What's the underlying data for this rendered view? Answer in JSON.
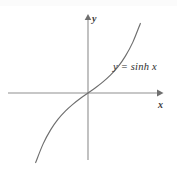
{
  "figure": {
    "title": "",
    "background_color": "#ffffff",
    "axis_color": "#8f8f8f",
    "curve_color": "#6e6e6e",
    "text_color": "#2e2e2e"
  },
  "labels": {
    "y_axis": "y",
    "x_axis": "x",
    "equation": "y = sinh x"
  },
  "chart_data": {
    "type": "line",
    "title": "",
    "xlabel": "x",
    "ylabel": "y",
    "annotations": [
      "y = sinh x"
    ],
    "grid": false,
    "legend": "none",
    "xlim": [
      -3,
      3
    ],
    "ylim": [
      -4.2,
      4.2
    ],
    "origin_px": [
      88,
      93
    ],
    "x": [
      -2.1,
      -1.8,
      -1.5,
      -1.2,
      -0.9,
      -0.6,
      -0.3,
      0,
      0.3,
      0.6,
      0.9,
      1.2,
      1.5,
      1.8,
      2.1
    ],
    "y": [
      -4.02,
      -2.94,
      -2.13,
      -1.51,
      -1.03,
      -0.64,
      -0.3,
      0,
      0.3,
      0.64,
      1.03,
      1.51,
      2.13,
      2.94,
      4.02
    ],
    "series": [
      {
        "name": "y = sinh x",
        "x": [
          -2.1,
          -1.8,
          -1.5,
          -1.2,
          -0.9,
          -0.6,
          -0.3,
          0,
          0.3,
          0.6,
          0.9,
          1.2,
          1.5,
          1.8,
          2.1
        ],
        "values": [
          -4.02,
          -2.94,
          -2.13,
          -1.51,
          -1.03,
          -0.64,
          -0.3,
          0,
          0.3,
          0.64,
          1.03,
          1.51,
          2.13,
          2.94,
          4.02
        ]
      }
    ],
    "xticks": [],
    "yticks": []
  }
}
